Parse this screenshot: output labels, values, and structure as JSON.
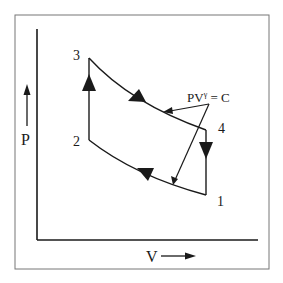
{
  "diagram": {
    "type": "P-V diagram (Otto cycle)",
    "axes": {
      "y_label": "P",
      "x_label": "V"
    },
    "points": [
      {
        "id": "1",
        "label": "1"
      },
      {
        "id": "2",
        "label": "2"
      },
      {
        "id": "3",
        "label": "3"
      },
      {
        "id": "4",
        "label": "4"
      }
    ],
    "annotation": {
      "base": "PV",
      "superscript": "γ",
      "rest": " = C"
    },
    "processes": [
      {
        "from": "1",
        "to": "2",
        "kind": "adiabatic compression"
      },
      {
        "from": "2",
        "to": "3",
        "kind": "constant volume heat addition"
      },
      {
        "from": "3",
        "to": "4",
        "kind": "adiabatic expansion"
      },
      {
        "from": "4",
        "to": "1",
        "kind": "constant volume heat rejection"
      }
    ],
    "colors": {
      "line": "#1a1a1a",
      "frame": "#777777",
      "background": "#ffffff"
    }
  }
}
